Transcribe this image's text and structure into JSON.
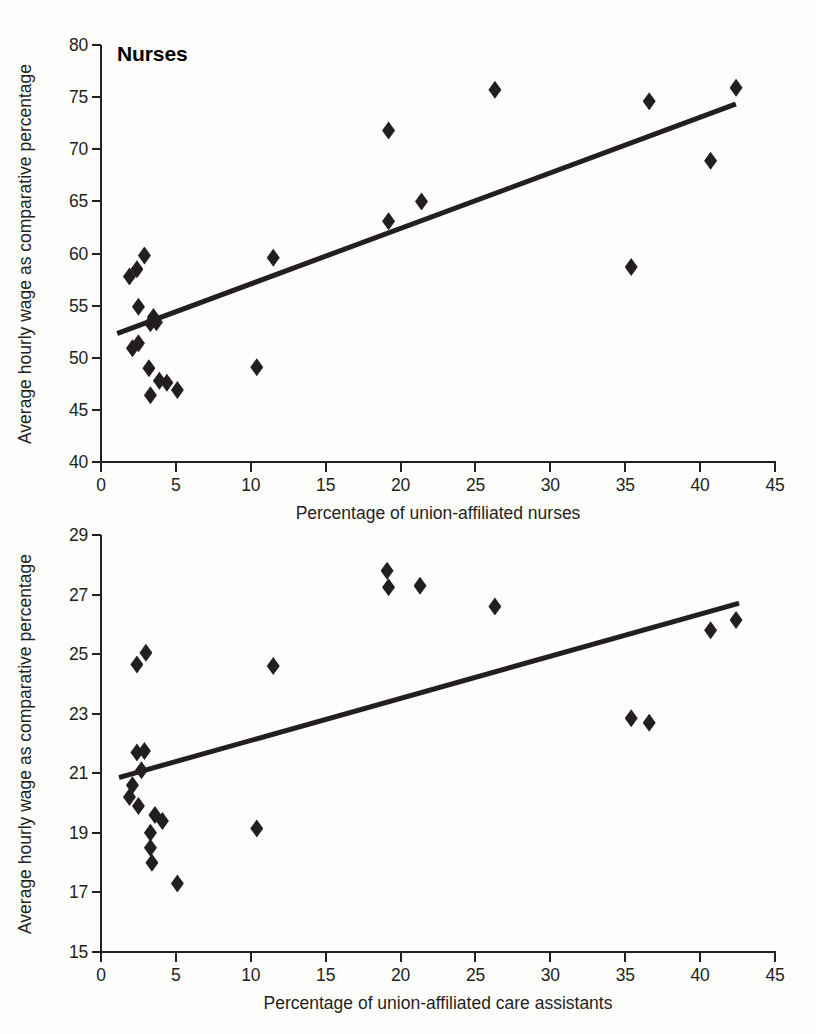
{
  "figure": {
    "marker_color": "#231f20",
    "line_color": "#231f20",
    "background": "#fdfdfb"
  },
  "panels": [
    {
      "id": "nurses",
      "title": "Nurses",
      "xlabel": "Percentage of union-affiliated nurses",
      "ylabel": "Average hourly wage as comparative percentage",
      "xticks": [
        "0",
        "5",
        "10",
        "15",
        "20",
        "25",
        "30",
        "35",
        "40",
        "45"
      ],
      "yticks": [
        "40",
        "45",
        "50",
        "55",
        "60",
        "65",
        "70",
        "75",
        "80"
      ]
    },
    {
      "id": "care",
      "title": "Care Assistants",
      "xlabel": "Percentage of union-affiliated care assistants",
      "ylabel": "Average hourly wage as comparative percentage",
      "xticks": [
        "0",
        "5",
        "10",
        "15",
        "20",
        "25",
        "30",
        "35",
        "40",
        "45"
      ],
      "yticks": [
        "15",
        "17",
        "19",
        "21",
        "23",
        "25",
        "27",
        "29"
      ]
    }
  ],
  "chart_data": [
    {
      "type": "scatter",
      "title": "Nurses",
      "xlabel": "Percentage of union-affiliated nurses",
      "ylabel": "Average hourly wage as comparative percentage",
      "xlim": [
        0,
        45
      ],
      "ylim": [
        40,
        80
      ],
      "xticks": [
        0,
        5,
        10,
        15,
        20,
        25,
        30,
        35,
        40,
        45
      ],
      "yticks": [
        40,
        45,
        50,
        55,
        60,
        65,
        70,
        75,
        80
      ],
      "grid": false,
      "legend": null,
      "marker": "diamond",
      "points": [
        {
          "x": 1.9,
          "y": 57.8
        },
        {
          "x": 2.1,
          "y": 50.9
        },
        {
          "x": 2.4,
          "y": 58.5
        },
        {
          "x": 2.5,
          "y": 51.4
        },
        {
          "x": 2.9,
          "y": 59.8
        },
        {
          "x": 2.5,
          "y": 54.9
        },
        {
          "x": 3.3,
          "y": 53.3
        },
        {
          "x": 3.5,
          "y": 53.9
        },
        {
          "x": 3.7,
          "y": 53.4
        },
        {
          "x": 3.2,
          "y": 49.0
        },
        {
          "x": 3.3,
          "y": 46.4
        },
        {
          "x": 3.9,
          "y": 47.8
        },
        {
          "x": 4.4,
          "y": 47.6
        },
        {
          "x": 5.1,
          "y": 46.9
        },
        {
          "x": 10.4,
          "y": 49.1
        },
        {
          "x": 11.5,
          "y": 59.6
        },
        {
          "x": 19.2,
          "y": 71.8
        },
        {
          "x": 19.2,
          "y": 63.1
        },
        {
          "x": 21.4,
          "y": 65.0
        },
        {
          "x": 26.3,
          "y": 75.7
        },
        {
          "x": 35.4,
          "y": 58.7
        },
        {
          "x": 36.6,
          "y": 74.6
        },
        {
          "x": 40.7,
          "y": 68.9
        },
        {
          "x": 42.4,
          "y": 75.9
        }
      ],
      "trendline": {
        "x0": 1.1,
        "y0": 52.3,
        "x1": 42.4,
        "y1": 74.3
      }
    },
    {
      "type": "scatter",
      "title": "Care Assistants",
      "xlabel": "Percentage of union-affiliated care assistants",
      "ylabel": "Average hourly wage as comparative percentage",
      "xlim": [
        0,
        45
      ],
      "ylim": [
        15,
        29
      ],
      "xticks": [
        0,
        5,
        10,
        15,
        20,
        25,
        30,
        35,
        40,
        45
      ],
      "yticks": [
        15,
        17,
        19,
        21,
        23,
        25,
        27,
        29
      ],
      "grid": false,
      "legend": null,
      "marker": "diamond",
      "points": [
        {
          "x": 1.9,
          "y": 20.2
        },
        {
          "x": 2.1,
          "y": 20.6
        },
        {
          "x": 2.4,
          "y": 24.65
        },
        {
          "x": 2.4,
          "y": 21.7
        },
        {
          "x": 2.5,
          "y": 19.9
        },
        {
          "x": 2.7,
          "y": 21.1
        },
        {
          "x": 2.9,
          "y": 21.75
        },
        {
          "x": 3.0,
          "y": 25.05
        },
        {
          "x": 3.3,
          "y": 19.0
        },
        {
          "x": 3.3,
          "y": 18.5
        },
        {
          "x": 3.4,
          "y": 18.0
        },
        {
          "x": 3.6,
          "y": 19.6
        },
        {
          "x": 4.1,
          "y": 19.4
        },
        {
          "x": 5.1,
          "y": 17.3
        },
        {
          "x": 10.4,
          "y": 19.15
        },
        {
          "x": 11.5,
          "y": 24.6
        },
        {
          "x": 19.1,
          "y": 27.8
        },
        {
          "x": 19.2,
          "y": 27.25
        },
        {
          "x": 21.3,
          "y": 27.3
        },
        {
          "x": 26.3,
          "y": 26.6
        },
        {
          "x": 35.4,
          "y": 22.85
        },
        {
          "x": 36.6,
          "y": 22.7
        },
        {
          "x": 40.7,
          "y": 25.8
        },
        {
          "x": 42.4,
          "y": 26.15
        }
      ],
      "trendline": {
        "x0": 1.2,
        "y0": 20.85,
        "x1": 42.6,
        "y1": 26.7
      }
    }
  ]
}
